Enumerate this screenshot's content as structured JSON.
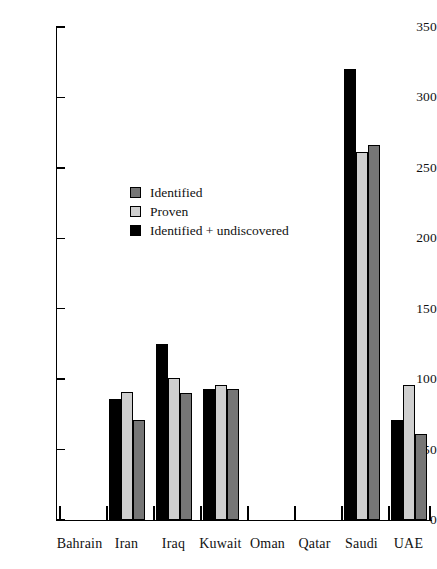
{
  "chart_data": {
    "type": "bar",
    "title": "",
    "subtitle": "",
    "xlabel": "",
    "ylabel": "",
    "ylim": [
      0,
      350
    ],
    "yticks": [
      0,
      50,
      100,
      150,
      200,
      250,
      300,
      350
    ],
    "grid": false,
    "legend_position": "inside-upper-left",
    "categories": [
      "Bahrain",
      "Iran",
      "Iraq",
      "Kuwait",
      "Oman",
      "Qatar",
      "Saudi",
      "UAE"
    ],
    "series": [
      {
        "name": "Identified",
        "color": "#767676",
        "values": [
          0,
          71,
          90,
          93,
          0,
          0,
          266,
          61
        ]
      },
      {
        "name": "Proven",
        "color": "#cfcfcf",
        "values": [
          0,
          91,
          101,
          96,
          0,
          0,
          261,
          96
        ]
      },
      {
        "name": "Identified + undiscovered",
        "color": "#000000",
        "values": [
          0,
          86,
          125,
          93,
          0,
          0,
          320,
          71
        ]
      }
    ],
    "series_draw_order": [
      "Identified + undiscovered",
      "Proven",
      "Identified"
    ],
    "annotations": []
  },
  "axis": {
    "y_tick_labels": [
      "0",
      "50",
      "100",
      "150",
      "200",
      "250",
      "300",
      "350"
    ]
  },
  "legend": {
    "items": [
      {
        "label": "Identified",
        "swatch": "identified-swatch"
      },
      {
        "label": "Proven",
        "swatch": "proven-swatch"
      },
      {
        "label": "Identified + undiscovered",
        "swatch": "undiscovered-swatch"
      }
    ]
  }
}
